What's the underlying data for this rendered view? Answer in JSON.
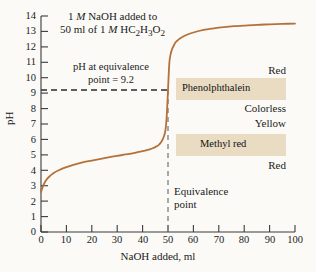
{
  "chart_data": {
    "type": "line",
    "title_line1_pre": "1 ",
    "title_line1_ital": "M",
    "title_line1_post": " NaOH added to",
    "title_line2_pre": "50 ml of 1 ",
    "title_line2_ital": "M",
    "title_line2_post": " HC2H3O2",
    "xlabel": "NaOH added, ml",
    "ylabel": "pH",
    "xlim": [
      0,
      100
    ],
    "ylim": [
      0,
      14
    ],
    "xticks": [
      0,
      10,
      20,
      30,
      40,
      50,
      60,
      70,
      80,
      90,
      100
    ],
    "yticks": [
      0,
      1,
      2,
      3,
      4,
      5,
      6,
      7,
      8,
      9,
      10,
      11,
      12,
      13,
      14
    ],
    "grid": false,
    "legend": "none",
    "series": [
      {
        "name": "Titration curve",
        "color": "#b5713a",
        "x": [
          0,
          1,
          2,
          3,
          5,
          7,
          10,
          13,
          16,
          20,
          24,
          28,
          32,
          35,
          38,
          40,
          42,
          43,
          44,
          45,
          45.5,
          46,
          46.5,
          47,
          47.5,
          48,
          48.5,
          49,
          49.5,
          50,
          50.5,
          51,
          51.5,
          52,
          53,
          54,
          55,
          57,
          60,
          64,
          68,
          72,
          76,
          80,
          85,
          90,
          95,
          100
        ],
        "y": [
          2.6,
          3.05,
          3.35,
          3.55,
          3.82,
          4.0,
          4.2,
          4.36,
          4.5,
          4.63,
          4.76,
          4.88,
          4.99,
          5.07,
          5.17,
          5.24,
          5.32,
          5.37,
          5.43,
          5.5,
          5.55,
          5.6,
          5.67,
          5.76,
          5.88,
          6.03,
          6.25,
          6.6,
          7.5,
          9.2,
          10.9,
          11.5,
          11.8,
          12.0,
          12.3,
          12.45,
          12.57,
          12.75,
          12.93,
          13.1,
          13.2,
          13.28,
          13.34,
          13.38,
          13.43,
          13.46,
          13.49,
          13.51
        ]
      }
    ],
    "annotations": {
      "equivalence_line1": "pH at equivalence",
      "equivalence_line2": "point = 9.2",
      "equivalence_ph": 9.2,
      "equivalence_volume": 50,
      "equivalence_marker_line1": "Equivalence",
      "equivalence_marker_line2": "point"
    },
    "indicator_bands": [
      {
        "name": "Phenolphthalein",
        "ph_low": 8.3,
        "ph_high": 10.0,
        "color_above": "Red",
        "color_below": "Colorless",
        "band_color": "#e9dcc3"
      },
      {
        "name": "Methyl red",
        "ph_low": 4.3,
        "ph_high": 6.0,
        "color_above": "Yellow",
        "color_below": "Red",
        "band_color": "#e9dcc3"
      }
    ]
  },
  "axis": {
    "ylabel": "pH",
    "xlabel": "NaOH added, ml",
    "yticks": [
      "14",
      "13",
      "12",
      "11",
      "10",
      "9",
      "8",
      "7",
      "6",
      "5",
      "4",
      "3",
      "2",
      "1",
      "0"
    ],
    "xticks": [
      "0",
      "10",
      "20",
      "30",
      "40",
      "50",
      "60",
      "70",
      "80",
      "90",
      "100"
    ]
  },
  "labels": {
    "phenolphthalein": "Phenolphthalein",
    "methyl_red": "Methyl red",
    "red_top": "Red",
    "colorless": "Colorless",
    "yellow": "Yellow",
    "red_bottom": "Red",
    "equivalence_line1": "pH at equivalence",
    "equivalence_line2": "point = 9.2",
    "equivalence_marker_line1": "Equivalence",
    "equivalence_marker_line2": "point"
  },
  "colors": {
    "curve": "#b5713a",
    "band": "#e9dcc3",
    "axis": "#3a3a3a",
    "background": "#fbfaf7"
  }
}
